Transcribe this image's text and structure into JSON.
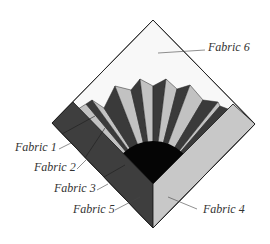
{
  "diagram": {
    "colors": {
      "background": "#fbfbfb",
      "fabric1": "#3a3a3a",
      "fabric2": "#c2c2c2",
      "fabric3": "#050505",
      "fabric4": "#c8c8c8",
      "fabric5": "#3e3e3e",
      "fabric6": "#f8f8f8",
      "outline": "#222222"
    },
    "block": {
      "top": [
        153,
        20
      ],
      "right": [
        255,
        124
      ],
      "bottom": [
        153,
        228
      ],
      "left": [
        52,
        123
      ],
      "inner_corner": [
        153,
        184
      ],
      "left_border_top": [
        73,
        102
      ],
      "right_border_top": [
        233,
        104
      ]
    },
    "fan": {
      "center": [
        153,
        184
      ],
      "quarter_circle_radius": 43,
      "outline_points": [
        [
          86,
          104
        ],
        [
          92,
          100
        ],
        [
          104,
          108
        ],
        [
          115,
          86
        ],
        [
          131,
          90
        ],
        [
          140,
          79
        ],
        [
          153,
          86
        ],
        [
          166,
          79
        ],
        [
          177,
          89
        ],
        [
          190,
          85
        ],
        [
          203,
          100
        ],
        [
          218,
          102
        ],
        [
          220,
          106
        ]
      ]
    },
    "labels": [
      {
        "id": "fabric-6",
        "text": "Fabric 6",
        "x": 208,
        "y": 51,
        "line": [
          [
            158,
            53
          ],
          [
            205,
            50
          ]
        ]
      },
      {
        "id": "fabric-1",
        "text": "Fabric 1",
        "x": 15,
        "y": 151,
        "line": [
          [
            59,
            149
          ],
          [
            71,
            143
          ]
        ]
      },
      {
        "id": "fabric-2",
        "text": "Fabric 2",
        "x": 34,
        "y": 171,
        "line": [
          [
            77,
            169
          ],
          [
            86,
            160
          ]
        ]
      },
      {
        "id": "fabric-3",
        "text": "Fabric 3",
        "x": 54,
        "y": 192,
        "line": [
          [
            97,
            190
          ],
          [
            108,
            184
          ]
        ]
      },
      {
        "id": "fabric-5",
        "text": "Fabric 5",
        "x": 73,
        "y": 213,
        "line": [
          [
            115,
            210
          ],
          [
            140,
            197
          ]
        ]
      },
      {
        "id": "fabric-4",
        "text": "Fabric 4",
        "x": 203,
        "y": 213,
        "line": [
          [
            168,
            197
          ],
          [
            197,
            209
          ]
        ]
      }
    ]
  }
}
